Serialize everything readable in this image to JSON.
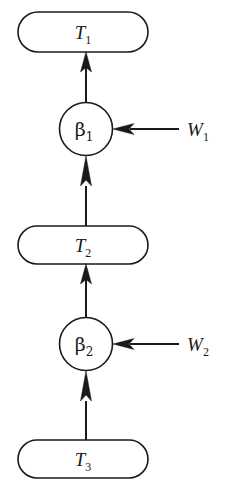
{
  "diagram": {
    "type": "vertical-flow-chain",
    "background_color": "#ffffff",
    "stroke_color": "#1a1a1a",
    "nodes": [
      {
        "id": "T1",
        "shape": "stadium",
        "base": "T",
        "subscript": "1",
        "label": "T1",
        "cx": 83,
        "cy": 32,
        "width": 130,
        "height": 40
      },
      {
        "id": "beta1",
        "shape": "circle",
        "base": "β",
        "subscript": "1",
        "label": "β1",
        "cx": 86,
        "cy": 129,
        "radius": 26.5
      },
      {
        "id": "T2",
        "shape": "stadium",
        "base": "T",
        "subscript": "2",
        "label": "T2",
        "cx": 83,
        "cy": 245,
        "width": 130,
        "height": 38
      },
      {
        "id": "beta2",
        "shape": "circle",
        "base": "β",
        "subscript": "2",
        "label": "β2",
        "cx": 86,
        "cy": 344,
        "radius": 26.5
      },
      {
        "id": "T3",
        "shape": "stadium",
        "base": "T",
        "subscript": "3",
        "label": "T3",
        "cx": 83,
        "cy": 459,
        "width": 130,
        "height": 38
      }
    ],
    "inputs": [
      {
        "id": "W1",
        "base": "W",
        "subscript": "1",
        "label": "W1",
        "x": 198,
        "y": 129,
        "target": "beta1"
      },
      {
        "id": "W2",
        "base": "W",
        "subscript": "2",
        "label": "W2",
        "x": 198,
        "y": 344,
        "target": "beta2"
      }
    ],
    "edges": [
      {
        "id": "edge-beta1-to-T1",
        "from": "beta1",
        "to": "T1",
        "direction": "up"
      },
      {
        "id": "edge-T2-to-beta1",
        "from": "T2",
        "to": "beta1",
        "direction": "up"
      },
      {
        "id": "edge-beta2-to-T2",
        "from": "beta2",
        "to": "T2",
        "direction": "up"
      },
      {
        "id": "edge-T3-to-beta2",
        "from": "T3",
        "to": "beta2",
        "direction": "up"
      },
      {
        "id": "edge-W1-to-beta1",
        "from": "W1",
        "to": "beta1",
        "direction": "left"
      },
      {
        "id": "edge-W2-to-beta2",
        "from": "W2",
        "to": "beta2",
        "direction": "left"
      }
    ]
  }
}
